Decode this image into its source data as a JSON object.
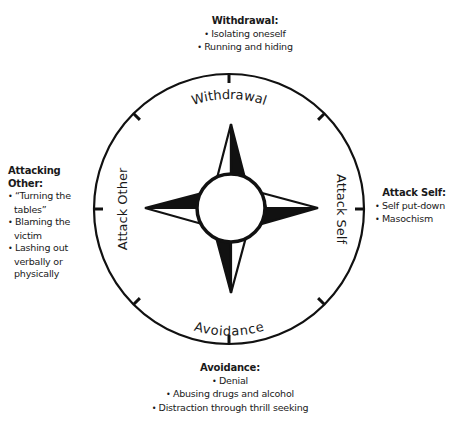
{
  "diagram": {
    "center": {
      "x": 229,
      "y": 209
    },
    "outer_radius": 135,
    "inner_radius": 34,
    "stroke_color": "#111111",
    "fill_color": "#111111",
    "background": "#ffffff",
    "ring_labels": {
      "top": "Withdrawal",
      "right": "Attack Self",
      "bottom": "Avoidance",
      "left": "Attack Other"
    }
  },
  "callouts": {
    "top": {
      "title": "Withdrawal:",
      "items": [
        "Isolating oneself",
        "Running and hiding"
      ]
    },
    "left": {
      "title": "Attacking Other:",
      "items": [
        "“Turning the tables”",
        "Blaming the victim",
        "Lashing out verbally or physically"
      ]
    },
    "right": {
      "title": "Attack Self:",
      "items": [
        "Self put-down",
        "Masochism"
      ]
    },
    "bottom": {
      "title": "Avoidance:",
      "items": [
        "Denial",
        "Abusing drugs and alcohol",
        "Distraction through thrill seeking"
      ]
    }
  }
}
